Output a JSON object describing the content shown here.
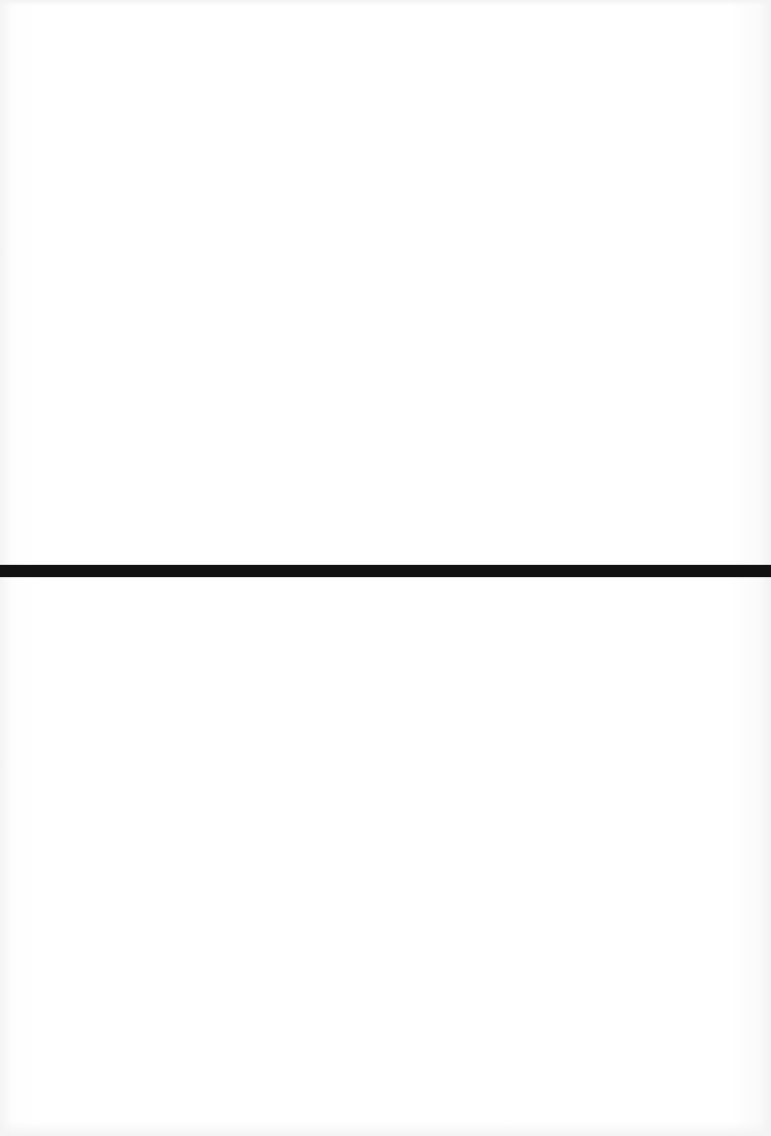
{
  "page": {
    "background_color": "#fefefe"
  },
  "rule": {
    "color": "#121212",
    "top_px": 565,
    "thickness_px": 12
  }
}
